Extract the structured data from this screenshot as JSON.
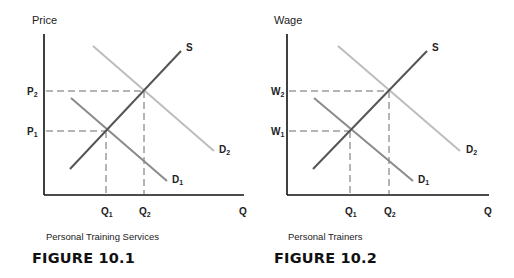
{
  "figures": [
    {
      "id": "fig1",
      "y_axis_label": "Price",
      "x_axis_label": "Q",
      "caption": "Personal Training Services",
      "figure_title": "FIGURE 10.1",
      "levels": {
        "low": "P",
        "low_sub": "1",
        "high": "P",
        "high_sub": "2"
      },
      "quantities": {
        "q1": "Q",
        "q1_sub": "1",
        "q2": "Q",
        "q2_sub": "2"
      },
      "curves": {
        "supply": "S",
        "demand1": "D",
        "demand1_sub": "1",
        "demand2": "D",
        "demand2_sub": "2"
      }
    },
    {
      "id": "fig2",
      "y_axis_label": "Wage",
      "x_axis_label": "Q",
      "caption": "Personal Trainers",
      "figure_title": "FIGURE 10.2",
      "levels": {
        "low": "W",
        "low_sub": "1",
        "high": "W",
        "high_sub": "2"
      },
      "quantities": {
        "q1": "Q",
        "q1_sub": "1",
        "q2": "Q",
        "q2_sub": "2"
      },
      "curves": {
        "supply": "S",
        "demand1": "D",
        "demand1_sub": "1",
        "demand2": "D",
        "demand2_sub": "2"
      }
    }
  ],
  "colors": {
    "axis": "#111111",
    "supply": "#555555",
    "demand1": "#8a8a8a",
    "demand2": "#bdbdbd",
    "dashed": "#6a6a6a"
  }
}
